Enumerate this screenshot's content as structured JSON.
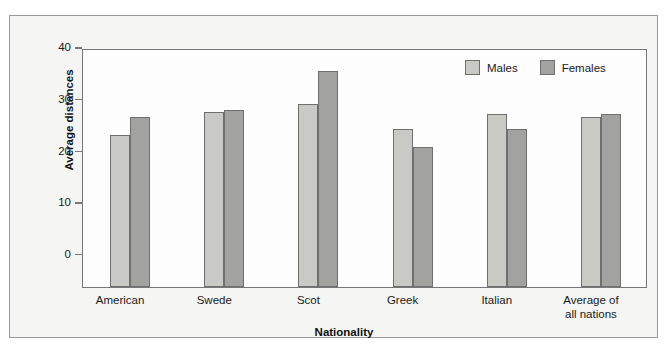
{
  "chart_data": {
    "type": "bar",
    "title": "",
    "xlabel": "Nationality",
    "ylabel": "Average distances",
    "categories": [
      "American",
      "Swede",
      "Scot",
      "Greek",
      "Italian",
      "Average of\nall nations"
    ],
    "series": [
      {
        "name": "Males",
        "color": "#c9c9c6",
        "values": [
          28.3,
          32.6,
          34.1,
          29.4,
          32.2,
          31.7
        ]
      },
      {
        "name": "Females",
        "color": "#a2a2a0",
        "values": [
          31.7,
          32.9,
          40.3,
          26.0,
          29.4,
          32.3
        ]
      }
    ],
    "yticks": [
      0,
      10,
      20,
      30,
      40
    ],
    "ytick_labels": [
      "0",
      "10",
      "20",
      "30",
      "40"
    ],
    "ylim": [
      0,
      44.5
    ],
    "grid": false,
    "legend_position": "top-right",
    "legend_entries": [
      "Males",
      "Females"
    ]
  },
  "figure": {
    "frame_color": "#9a9a98",
    "plot_background": "#fdfdfd",
    "outer_background": "#f5f5f4",
    "axis_color": "#77777a",
    "bar_edge_color": "#6f6f70"
  }
}
